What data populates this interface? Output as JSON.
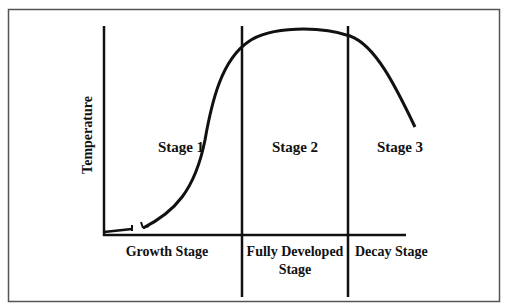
{
  "diagram": {
    "y_axis_label": "Temperature",
    "regions": [
      {
        "stage_label": "Stage 1",
        "phase_label_lines": [
          "Growth Stage"
        ]
      },
      {
        "stage_label": "Stage 2",
        "phase_label_lines": [
          "Fully Developed",
          "Stage"
        ]
      },
      {
        "stage_label": "Stage 3",
        "phase_label_lines": [
          "Decay Stage"
        ]
      }
    ],
    "colors": {
      "frame": "#555555",
      "lines": "#111111",
      "background": "#ffffff"
    }
  }
}
